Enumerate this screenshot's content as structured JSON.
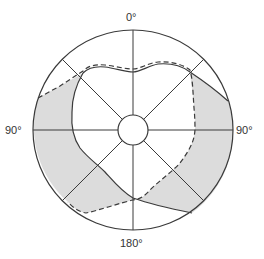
{
  "diagram": {
    "type": "polar-visual-field",
    "labels": {
      "top": "0°",
      "left": "90°",
      "right": "90°",
      "bottom": "180°"
    },
    "colors": {
      "outline": "#3a3a3a",
      "shade": "#dcdcdc",
      "background": "#ffffff"
    },
    "legend": {
      "solid_curve": "solid boundary",
      "dashed_curve": "dashed boundary",
      "shaded_region": "area between boundaries"
    },
    "spokes_deg": [
      0,
      45,
      90,
      135,
      180,
      225,
      270,
      315
    ]
  }
}
